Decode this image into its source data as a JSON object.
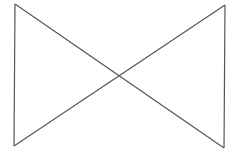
{
  "diagram": {
    "shape": "bowtie",
    "stroke_color": "#555555",
    "background": "#ffffff",
    "points": {
      "top_left": [
        15,
        4
      ],
      "top_right": [
        225,
        5
      ],
      "bottom_left": [
        14,
        146
      ],
      "bottom_right": [
        224,
        148
      ]
    },
    "segments": [
      {
        "name": "left-edge",
        "from": [
          15,
          4
        ],
        "to": [
          14,
          146
        ]
      },
      {
        "name": "diagonal-down",
        "from": [
          15,
          4
        ],
        "to": [
          224,
          148
        ]
      },
      {
        "name": "right-edge",
        "from": [
          225,
          5
        ],
        "to": [
          224,
          148
        ]
      },
      {
        "name": "diagonal-up",
        "from": [
          14,
          146
        ],
        "to": [
          225,
          5
        ]
      }
    ]
  }
}
